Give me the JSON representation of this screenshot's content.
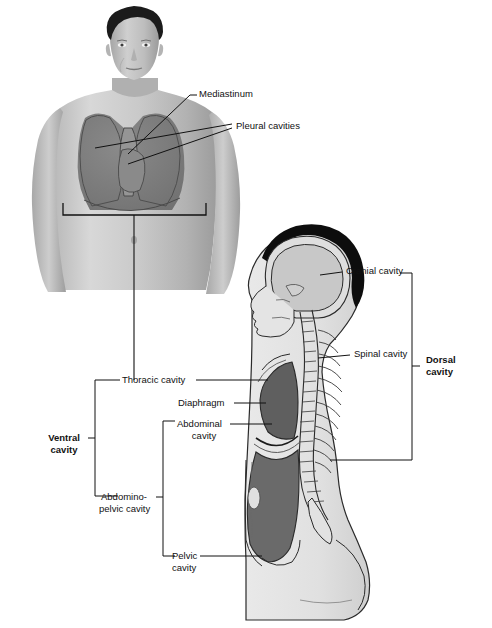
{
  "figure": {
    "background": "#ffffff",
    "line_color": "#1a1a1a",
    "cavity_fill": "#7b7b7b",
    "cavity_fill_dark": "#6a6a6a",
    "mediastinum_fill": "#8d8d8d",
    "body_fill": "#e6e6e6",
    "body_fill_shadow": "#d2d2d2",
    "hair_fill": "#0d0d0d",
    "bone_fill": "#efefef"
  },
  "labels": {
    "mediastinum": "Mediastinum",
    "pleural_cavities": "Pleural cavities",
    "cranial_cavity": "Cranial cavity",
    "spinal_cavity": "Spinal cavity",
    "dorsal_cavity_line1": "Dorsal",
    "dorsal_cavity_line2": "cavity",
    "thoracic_cavity": "Thoracic cavity",
    "diaphragm": "Diaphragm",
    "abdominal_cavity_line1": "Abdominal",
    "abdominal_cavity_line2": "cavity",
    "ventral_cavity_line1": "Ventral",
    "ventral_cavity_line2": "cavity",
    "abdominopelvic_cavity_line1": "Abdomino-",
    "abdominopelvic_cavity_line2": "pelvic cavity",
    "pelvic_cavity_line1": "Pelvic",
    "pelvic_cavity_line2": "cavity"
  },
  "structures": {
    "anterior_view": "male torso anterior view with thoracic cavity shaded",
    "sagittal_view": "midsagittal section showing dorsal and ventral cavities"
  }
}
